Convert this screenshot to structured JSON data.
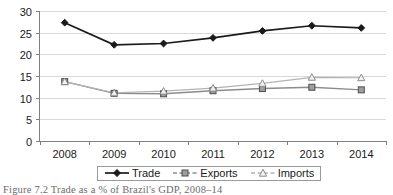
{
  "chart_data": {
    "type": "line",
    "title": "",
    "xlabel": "",
    "ylabel": "",
    "categories": [
      "2008",
      "2009",
      "2010",
      "2011",
      "2012",
      "2013",
      "2014"
    ],
    "ylim": [
      0,
      30
    ],
    "yticks": [
      0,
      5,
      10,
      15,
      20,
      25,
      30
    ],
    "grid": true,
    "legend_position": "bottom",
    "series": [
      {
        "name": "Trade",
        "marker": "diamond",
        "color": "#1a1a1a",
        "linestyle": "solid",
        "values": [
          27.3,
          22.2,
          22.5,
          23.8,
          25.4,
          26.6,
          26.1
        ]
      },
      {
        "name": "Exports",
        "marker": "square",
        "color": "#8c8c8c",
        "linestyle": "dashed",
        "values": [
          13.7,
          11.0,
          10.9,
          11.6,
          12.1,
          12.4,
          11.8
        ]
      },
      {
        "name": "Imports",
        "marker": "triangle",
        "color": "#b3b3b3",
        "linestyle": "dashed",
        "values": [
          13.7,
          11.1,
          11.5,
          12.2,
          13.3,
          14.7,
          14.6
        ]
      }
    ]
  },
  "axis": {
    "y_labels": [
      "30",
      "25",
      "20",
      "15",
      "10",
      "5",
      "0"
    ],
    "x_labels": [
      "2008",
      "2009",
      "2010",
      "2011",
      "2012",
      "2013",
      "2014"
    ]
  },
  "legend": {
    "items": [
      {
        "label": "Trade",
        "icon": "diamond-marker-icon"
      },
      {
        "label": "Exports",
        "icon": "square-marker-icon"
      },
      {
        "label": "Imports",
        "icon": "triangle-marker-icon"
      }
    ]
  },
  "caption": {
    "text": "Figure 7.2 Trade as a % of Brazil's GDP, 2008–14"
  }
}
